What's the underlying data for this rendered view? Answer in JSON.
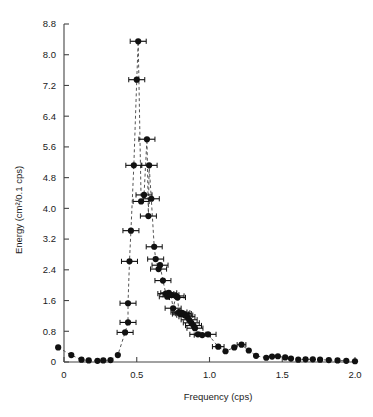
{
  "chart_data": {
    "type": "scatter",
    "title": "",
    "xlabel": "Frequency (cps)",
    "ylabel": "Energy (cm²/0.1 cps)",
    "xlim": [
      -0.08,
      2.03
    ],
    "ylim": [
      -0.12,
      8.8
    ],
    "grid": false,
    "legend": null,
    "xticks": [
      0,
      0.5,
      1.0,
      1.5,
      2.0
    ],
    "xticklabels": [
      "0",
      "0.5",
      "1.0",
      "1.5",
      "2.0"
    ],
    "yticks": [
      0,
      0.8,
      1.6,
      2.4,
      3.2,
      4.0,
      4.8,
      5.6,
      6.4,
      7.2,
      8.0,
      8.8
    ],
    "yticklabels": [
      "0",
      "0.8",
      "1.6",
      "2.4",
      "3.2",
      "4.0",
      "4.8",
      "5.6",
      "6.4",
      "7.2",
      "8.0",
      "8.8"
    ],
    "marker": "filled-circle",
    "marker_color": "#111111",
    "line_style": "dashed",
    "line_color": "#555555",
    "errorbars": "horizontal",
    "series": [
      {
        "name": "Wave energy spectrum",
        "connected": true,
        "x": [
          -0.04,
          0.05,
          0.12,
          0.17,
          0.23,
          0.27,
          0.32,
          0.37,
          0.42,
          0.44,
          0.44,
          0.45,
          0.46,
          0.48,
          0.5,
          0.51,
          0.53,
          0.55,
          0.57,
          0.58,
          0.585,
          0.6,
          0.62,
          0.63,
          0.65,
          0.66,
          0.68,
          0.7,
          0.71,
          0.72,
          0.735,
          0.75,
          0.77,
          0.78,
          0.79,
          0.8,
          0.81,
          0.82,
          0.83,
          0.845,
          0.86,
          0.875,
          0.89,
          0.9,
          0.92,
          0.95,
          0.99,
          1.06,
          1.11,
          1.17,
          1.22,
          1.27,
          1.32,
          1.39,
          1.43,
          1.47,
          1.52,
          1.56,
          1.61,
          1.66,
          1.71,
          1.76,
          1.82,
          1.88,
          1.94,
          2.0
        ],
        "y": [
          0.38,
          0.18,
          0.06,
          0.04,
          0.03,
          0.04,
          0.05,
          0.18,
          0.77,
          1.03,
          1.53,
          2.62,
          3.42,
          5.12,
          7.35,
          8.35,
          4.18,
          4.35,
          5.8,
          3.8,
          5.12,
          4.25,
          3.0,
          2.68,
          2.42,
          2.52,
          2.12,
          1.78,
          1.7,
          1.8,
          1.75,
          1.4,
          1.72,
          1.68,
          1.3,
          1.25,
          1.28,
          1.26,
          1.22,
          1.18,
          1.1,
          1.02,
          0.95,
          0.88,
          0.72,
          0.7,
          0.72,
          0.4,
          0.28,
          0.38,
          0.45,
          0.3,
          0.16,
          0.11,
          0.14,
          0.15,
          0.12,
          0.09,
          0.06,
          0.07,
          0.07,
          0.06,
          0.05,
          0.04,
          0.03,
          0.02
        ],
        "xerr": [
          0,
          0,
          0,
          0,
          0,
          0,
          0,
          0,
          0.055,
          0.055,
          0.055,
          0.055,
          0.055,
          0.055,
          0.055,
          0.055,
          0.055,
          0.055,
          0.055,
          0.055,
          0.055,
          0.055,
          0.055,
          0.055,
          0.055,
          0.055,
          0.055,
          0.055,
          0.055,
          0.055,
          0.055,
          0.055,
          0.055,
          0.055,
          0.055,
          0.055,
          0.055,
          0.055,
          0.055,
          0.055,
          0.055,
          0.055,
          0.055,
          0.055,
          0.055,
          0.055,
          0.055,
          0.04,
          0,
          0,
          0.03,
          0,
          0,
          0,
          0,
          0,
          0,
          0,
          0,
          0,
          0,
          0,
          0,
          0,
          0,
          0
        ]
      }
    ],
    "notes": {
      "peak_frequency": 0.51,
      "peak_energy": 8.35
    }
  },
  "axis": {
    "xlabel": "Frequency (cps)",
    "ylabel": "Energy (cm²/0.1 cps)"
  }
}
